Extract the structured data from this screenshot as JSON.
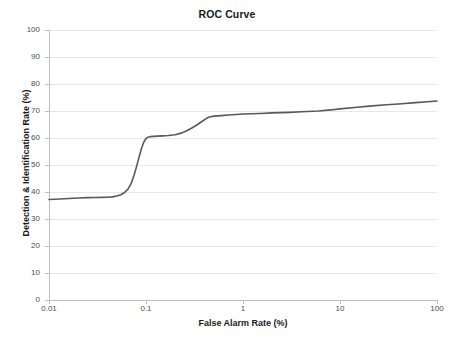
{
  "chart_data": {
    "type": "line",
    "title": "ROC Curve",
    "xlabel": "False Alarm Rate (%)",
    "ylabel": "Detection & Identification Rate (%)",
    "xscale": "log",
    "xlim": [
      0.01,
      100
    ],
    "ylim": [
      0,
      100
    ],
    "grid": "horizontal",
    "legend": "none",
    "xticks": [
      {
        "value": 0.01,
        "label": "0.01"
      },
      {
        "value": 0.1,
        "label": "0.1"
      },
      {
        "value": 1,
        "label": "1"
      },
      {
        "value": 10,
        "label": "10"
      },
      {
        "value": 100,
        "label": "100"
      }
    ],
    "yticks": [
      {
        "value": 0,
        "label": "0"
      },
      {
        "value": 10,
        "label": "10"
      },
      {
        "value": 20,
        "label": "20"
      },
      {
        "value": 30,
        "label": "30"
      },
      {
        "value": 40,
        "label": "40"
      },
      {
        "value": 50,
        "label": "50"
      },
      {
        "value": 60,
        "label": "60"
      },
      {
        "value": 70,
        "label": "70"
      },
      {
        "value": 80,
        "label": "80"
      },
      {
        "value": 90,
        "label": "90"
      },
      {
        "value": 100,
        "label": "100"
      }
    ],
    "series": [
      {
        "name": "ROC",
        "color": "#595959",
        "line_width": 1.6,
        "x": [
          0.01,
          0.013,
          0.016,
          0.02,
          0.025,
          0.03,
          0.035,
          0.04,
          0.045,
          0.05,
          0.055,
          0.06,
          0.065,
          0.07,
          0.075,
          0.08,
          0.085,
          0.09,
          0.095,
          0.1,
          0.105,
          0.11,
          0.12,
          0.13,
          0.15,
          0.17,
          0.2,
          0.23,
          0.26,
          0.3,
          0.34,
          0.38,
          0.42,
          0.45,
          0.5,
          0.6,
          0.7,
          0.85,
          1,
          1.5,
          2,
          3,
          4,
          6,
          8,
          10,
          15,
          20,
          30,
          40,
          60,
          80,
          100
        ],
        "y": [
          37.2,
          37.4,
          37.6,
          37.75,
          37.9,
          37.95,
          38.0,
          38.05,
          38.2,
          38.5,
          39.0,
          39.8,
          41.0,
          43.0,
          46.0,
          49.5,
          53.0,
          56.2,
          58.5,
          59.8,
          60.3,
          60.5,
          60.6,
          60.7,
          60.8,
          60.9,
          61.2,
          61.8,
          62.6,
          63.8,
          65.0,
          66.2,
          67.3,
          67.8,
          68.1,
          68.3,
          68.5,
          68.7,
          68.9,
          69.1,
          69.3,
          69.5,
          69.7,
          70.0,
          70.4,
          70.8,
          71.4,
          71.8,
          72.3,
          72.6,
          73.1,
          73.4,
          73.7
        ]
      }
    ],
    "colors": {
      "curve": "#595959",
      "gridline": "#e8e8e8",
      "axis": "#bfbfbf",
      "tick_text": "#4d4d4d",
      "title_text": "#1a1a1a",
      "background": "#ffffff"
    }
  }
}
